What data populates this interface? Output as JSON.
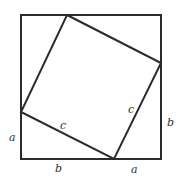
{
  "diagram": {
    "colors": {
      "stroke": "#2b2b2b",
      "label": "#333333",
      "background": "#ffffff"
    },
    "outer_square": {
      "x1": 21,
      "y1": 15,
      "x2": 161,
      "y2": 159
    },
    "inner_square": [
      [
        67,
        15
      ],
      [
        161,
        63
      ],
      [
        114,
        159
      ],
      [
        21,
        112
      ]
    ],
    "labels": [
      {
        "id": "left-a",
        "text": "a",
        "x": 9,
        "y": 141
      },
      {
        "id": "bottom-b",
        "text": "b",
        "x": 55,
        "y": 172
      },
      {
        "id": "bottom-a",
        "text": "a",
        "x": 131,
        "y": 173
      },
      {
        "id": "right-b",
        "text": "b",
        "x": 167,
        "y": 126
      },
      {
        "id": "lower-c",
        "text": "c",
        "x": 60,
        "y": 129
      },
      {
        "id": "right-c",
        "text": "c",
        "x": 128,
        "y": 113
      }
    ]
  }
}
